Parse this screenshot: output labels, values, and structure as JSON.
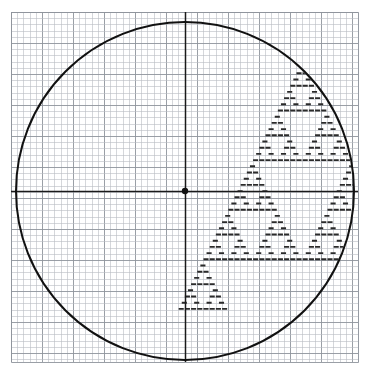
{
  "figure": {
    "title": "Sierpinski triangle on graph paper within a circle",
    "description": "Hand-drawn style mathematical figure: square-ruled graph paper with a large inscribed circle, horizontal and vertical coordinate axes crossing at a marked origin dot, and a Sierpinski-gasket (Pascal's triangle modulo 2) fractal rendered as short horizontal pen dashes filling the lower-right/lower-left of the disc.",
    "width": 370,
    "height": 372,
    "background_color": "#ffffff"
  },
  "grid": {
    "name": "graph-paper-grid",
    "x": 11,
    "y": 12,
    "width": 347,
    "height": 350,
    "minor_spacing": 6.2,
    "major_every": 5,
    "minor_color": "#b9bcc2",
    "major_color": "#8f949c",
    "border_color": "#8f949c",
    "minor_width": 0.6,
    "major_width": 0.9
  },
  "circle": {
    "name": "inscribed-circle",
    "center_x": 185,
    "center_y": 191,
    "radius": 169,
    "stroke_color": "#111111",
    "stroke_width": 2.0
  },
  "axes": {
    "name": "coordinate-axes",
    "stroke_color": "#1a1a1a",
    "stroke_width": 1.5,
    "horizontal": {
      "y": 191,
      "x1": 11,
      "x2": 358
    },
    "vertical": {
      "x": 185,
      "y1": 12,
      "y2": 362
    },
    "origin_dot": {
      "x": 185,
      "y": 191,
      "radius": 3.2,
      "color": "#111111"
    }
  },
  "chart_data": {
    "type": "scatter",
    "xlabel": "",
    "ylabel": "",
    "xlim": [
      0,
      64
    ],
    "ylim": [
      0,
      40
    ],
    "grid": true,
    "legend": null,
    "tick_labels_x": [],
    "tick_labels_y": [],
    "annotations": [],
    "fractal": {
      "rule": "cell (row, col) inked when binomial(row, col) is odd, i.e. (col AND (row - col)) == 0",
      "rows": 40,
      "apex_cell_x": 299,
      "apex_cell_y": 64,
      "cell_width": 6.2,
      "cell_height": 6.2,
      "dash_color": "#2a2a2a",
      "dash_thickness": 1.9,
      "dash_inset": 0.55,
      "row_skew_per_row": -3.1,
      "clip_to_circle": true
    }
  }
}
